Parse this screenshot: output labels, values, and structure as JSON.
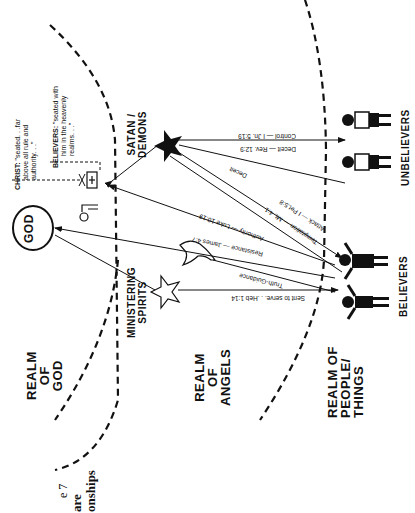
{
  "caption": {
    "figure": "e 7",
    "line1": "are",
    "line2": "onships"
  },
  "realms": {
    "god": [
      "REALM",
      "OF",
      "GOD"
    ],
    "angels": [
      "REALM",
      "OF",
      "ANGELS"
    ],
    "people": [
      "REALM OF",
      "PEOPLE/",
      "THINGS"
    ]
  },
  "entities": {
    "god": "GOD",
    "ministering_spirits": [
      "MINISTERING",
      "SPIRITS"
    ],
    "satan": [
      "SATAN /",
      "DEMONS"
    ],
    "believers": "BELIEVERS",
    "unbelievers": "UNBELIEVERS"
  },
  "quotes": {
    "christ_label": "CHRIST:",
    "christ_text_1": "\"seated. . .far",
    "christ_text_2": "above all rule and",
    "christ_text_3": "authority. . .\"",
    "believers_label": "BELIEVERS:",
    "believers_text_1": "\"seated with",
    "believers_text_2": "him in the heavenly",
    "believers_text_3": "realms. . .\""
  },
  "arrows": {
    "control": "Control — I Jn. 5:19",
    "deceit_rev": "Deceit — Rev. 12:9",
    "deceit": "Deceit",
    "attack": "Attack — I Pet.5:8",
    "temptation": "Temptation — Mt. 4:1",
    "authority": "Authority — Luke 10:19",
    "resistance": "Resistance — James 4:7",
    "truth": "Truth-Guidance",
    "sent": "Sent to serve. . .Heb 1:14"
  },
  "icons": {
    "god_circle": "circle",
    "cross_throne": "throne-with-cross",
    "throne": "empty-throne",
    "satan_star": "filled-star",
    "spirit_star": "outline-star",
    "dove": "dove",
    "believer_figure": "raised-arms-person",
    "unbeliever_figure": "standing-person"
  },
  "colors": {
    "ink": "#111111",
    "paper": "#ffffff"
  }
}
